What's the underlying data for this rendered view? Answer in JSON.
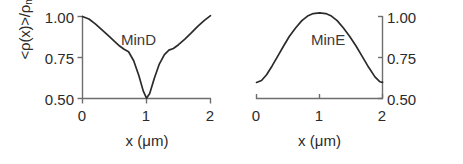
{
  "figure": {
    "background": "#ffffff",
    "axis_color": "#6e6e6e",
    "curve_color": "#2b2b2b",
    "text_color": "#2b2b2b"
  },
  "chart_data": [
    {
      "type": "line",
      "title": "MinD",
      "panel": "left",
      "xlabel": "x (μm)",
      "ylabel": "<ρ(x)>/ρmax",
      "ylabel_base": "<ρ(x)>/ρ",
      "ylabel_sub": "max",
      "xlim": [
        0,
        2
      ],
      "ylim": [
        0.5,
        1.0
      ],
      "xticks": [
        0,
        1,
        2
      ],
      "xticklabels": [
        "0",
        "1",
        "2"
      ],
      "yticks": [
        0.5,
        0.75,
        1.0
      ],
      "yticklabels": [
        "0.50",
        "0.75",
        "1.00"
      ],
      "yaxis_side": "left",
      "grid": false,
      "legend": "none",
      "annotations": [
        "MinD"
      ],
      "x": [
        0.0,
        0.1,
        0.2,
        0.3,
        0.4,
        0.5,
        0.58,
        0.65,
        0.72,
        0.8,
        0.88,
        0.95,
        1.0,
        1.05,
        1.12,
        1.2,
        1.28,
        1.35,
        1.42,
        1.5,
        1.6,
        1.7,
        1.8,
        1.9,
        2.0
      ],
      "y": [
        1.0,
        0.985,
        0.955,
        0.92,
        0.885,
        0.848,
        0.82,
        0.8,
        0.785,
        0.73,
        0.64,
        0.545,
        0.502,
        0.53,
        0.62,
        0.71,
        0.768,
        0.795,
        0.805,
        0.828,
        0.862,
        0.9,
        0.94,
        0.975,
        1.005
      ]
    },
    {
      "type": "line",
      "title": "MinE",
      "panel": "right",
      "xlabel": "x (μm)",
      "ylabel": "",
      "xlim": [
        0,
        2
      ],
      "ylim": [
        0.5,
        1.0
      ],
      "xticks": [
        0,
        1,
        2
      ],
      "xticklabels": [
        "0",
        "1",
        "2"
      ],
      "yticks": [
        0.5,
        0.75,
        1.0
      ],
      "yticklabels": [
        "0.50",
        "0.75",
        "1.00"
      ],
      "yaxis_side": "right",
      "grid": false,
      "legend": "none",
      "annotations": [
        "MinE"
      ],
      "x": [
        0.0,
        0.08,
        0.16,
        0.25,
        0.34,
        0.43,
        0.52,
        0.62,
        0.72,
        0.82,
        0.9,
        1.0,
        1.1,
        1.18,
        1.28,
        1.38,
        1.48,
        1.58,
        1.68,
        1.78,
        1.88,
        1.96,
        2.0
      ],
      "y": [
        0.598,
        0.61,
        0.645,
        0.7,
        0.76,
        0.82,
        0.878,
        0.93,
        0.975,
        1.005,
        1.018,
        1.022,
        1.018,
        1.005,
        0.975,
        0.93,
        0.878,
        0.82,
        0.755,
        0.69,
        0.632,
        0.602,
        0.598
      ]
    }
  ],
  "axes": {
    "left_panel": {
      "x_axis_label": "x (μm)",
      "y_axis_label_base": "<ρ(x)>/ρ",
      "y_axis_label_sub": "max",
      "xticklabels": [
        "0",
        "1",
        "2"
      ],
      "yticklabels": [
        "1.00",
        "0.75",
        "0.50"
      ],
      "series_label": "MinD"
    },
    "right_panel": {
      "x_axis_label": "x (μm)",
      "xticklabels": [
        "0",
        "1",
        "2"
      ],
      "yticklabels": [
        "1.00",
        "0.75",
        "0.50"
      ],
      "series_label": "MinE"
    }
  }
}
